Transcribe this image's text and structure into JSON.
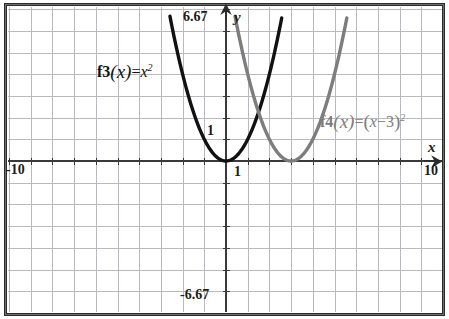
{
  "figure": {
    "type": "graph",
    "background": "#ffffff",
    "border_color": "#2b2b2b",
    "grid_color": "#b9b9bf",
    "axis_color": "#3a3a3a"
  },
  "axes": {
    "x_name": "x",
    "y_name": "y",
    "x_min_label": "-10",
    "x_max_label": "10",
    "x_unit_label": "1",
    "y_max_label": "6.67",
    "y_min_label": "-6.67",
    "y_unit_label": "1"
  },
  "curves": {
    "f3": {
      "label_fn": "f3",
      "label_arg": "(x)",
      "label_eq": "=",
      "label_body": "x",
      "label_exp": "2",
      "color": "#111111"
    },
    "f4": {
      "label_fn": "f4",
      "label_arg": "(x)",
      "label_eq": "=",
      "label_open": "(",
      "label_body": "x",
      "label_minus": "−3",
      "label_close": ")",
      "label_exp": "2",
      "color": "#7d7d7d"
    }
  },
  "chart_data": {
    "type": "line",
    "title": "",
    "xlabel": "x",
    "ylabel": "y",
    "xlim": [
      -10,
      10
    ],
    "ylim": [
      -6.67,
      6.67
    ],
    "grid": true,
    "grid_step": 1,
    "legend": "inline-annotations",
    "annotations": [
      {
        "text": "f3(x)=x^2",
        "x": -5.2,
        "y": 4.3,
        "color": "#111111"
      },
      {
        "text": "f4(x)=(x-3)^2",
        "x": 4.6,
        "y": 1.6,
        "color": "#7d7d7d"
      }
    ],
    "tick_labels": {
      "x": [
        {
          "value": -10,
          "label": "-10"
        },
        {
          "value": 1,
          "label": "1"
        },
        {
          "value": 10,
          "label": "10"
        }
      ],
      "y": [
        {
          "value": 6.67,
          "label": "6.67"
        },
        {
          "value": 1,
          "label": "1"
        },
        {
          "value": -6.67,
          "label": "-6.67"
        }
      ]
    },
    "series": [
      {
        "name": "f3(x)=x^2",
        "color": "#111111",
        "equation": "y = x^2",
        "vertex": [
          0,
          0
        ],
        "points": [
          {
            "x": -2.6,
            "y": 6.67
          },
          {
            "x": -2.4,
            "y": 5.76
          },
          {
            "x": -2.0,
            "y": 4.0
          },
          {
            "x": -1.6,
            "y": 2.56
          },
          {
            "x": -1.2,
            "y": 1.44
          },
          {
            "x": -0.8,
            "y": 0.64
          },
          {
            "x": -0.4,
            "y": 0.16
          },
          {
            "x": 0.0,
            "y": 0.0
          },
          {
            "x": 0.4,
            "y": 0.16
          },
          {
            "x": 0.8,
            "y": 0.64
          },
          {
            "x": 1.2,
            "y": 1.44
          },
          {
            "x": 1.6,
            "y": 2.56
          },
          {
            "x": 2.0,
            "y": 4.0
          },
          {
            "x": 2.4,
            "y": 5.76
          },
          {
            "x": 2.6,
            "y": 6.67
          }
        ]
      },
      {
        "name": "f4(x)=(x-3)^2",
        "color": "#7d7d7d",
        "equation": "y = (x-3)^2",
        "vertex": [
          3,
          0
        ],
        "points": [
          {
            "x": 0.4,
            "y": 6.67
          },
          {
            "x": 0.6,
            "y": 5.76
          },
          {
            "x": 1.0,
            "y": 4.0
          },
          {
            "x": 1.4,
            "y": 2.56
          },
          {
            "x": 1.8,
            "y": 1.44
          },
          {
            "x": 2.2,
            "y": 0.64
          },
          {
            "x": 2.6,
            "y": 0.16
          },
          {
            "x": 3.0,
            "y": 0.0
          },
          {
            "x": 3.4,
            "y": 0.16
          },
          {
            "x": 3.8,
            "y": 0.64
          },
          {
            "x": 4.2,
            "y": 1.44
          },
          {
            "x": 4.6,
            "y": 2.56
          },
          {
            "x": 5.0,
            "y": 4.0
          },
          {
            "x": 5.4,
            "y": 5.76
          },
          {
            "x": 5.6,
            "y": 6.67
          }
        ]
      }
    ]
  }
}
